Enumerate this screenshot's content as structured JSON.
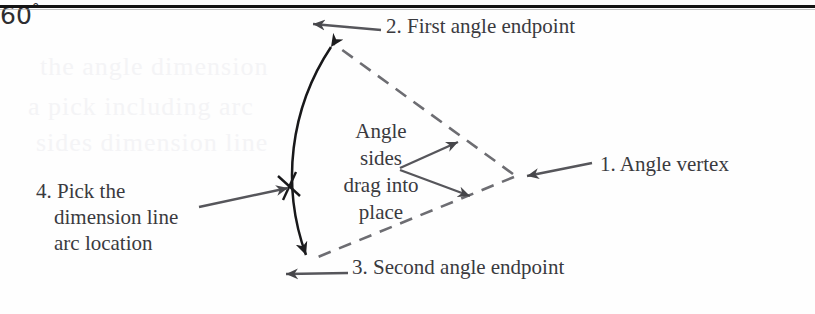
{
  "figure": {
    "name": "angle-dimension-diagram",
    "frame": {
      "top_rule_color": "#141414"
    },
    "background_color": "#fefefe",
    "ink_color": "#3a3a3e",
    "ghost_lines": [
      "the angle  dimension",
      "a  pick  including  arc",
      "sides  dimension  line"
    ]
  },
  "labels": {
    "vertex": "1. Angle vertex",
    "first_endpoint": "2. First angle endpoint",
    "second_endpoint": "3. Second angle endpoint",
    "pick_arc": {
      "line1": "4. Pick the",
      "line2": "dimension line",
      "line3": "arc location"
    },
    "angle_sides": {
      "line1": "Angle",
      "line2": "sides",
      "line3": "drag into",
      "line4": "place"
    },
    "angle_value": "60",
    "angle_degree_symbol": "°"
  },
  "geometry": {
    "vertex": {
      "x": 515,
      "y": 175
    },
    "first_endpoint": {
      "x": 326,
      "y": 38
    },
    "second_endpoint": {
      "x": 303,
      "y": 262
    },
    "arc_radius": 232,
    "angle_degrees": 60,
    "dimension_arc_tick": {
      "x": 292,
      "y": 186
    }
  }
}
